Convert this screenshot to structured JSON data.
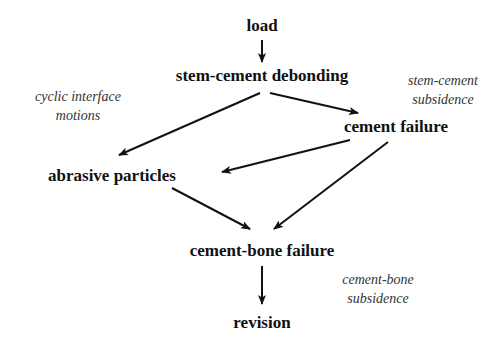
{
  "diagram": {
    "nodes": [
      {
        "id": "load",
        "label": "load"
      },
      {
        "id": "debond",
        "label": "stem-cement debonding"
      },
      {
        "id": "cement_failure",
        "label": "cement failure"
      },
      {
        "id": "abrasive",
        "label": "abrasive particles"
      },
      {
        "id": "cb_failure",
        "label": "cement-bone failure"
      },
      {
        "id": "revision",
        "label": "revision"
      }
    ],
    "annotations": [
      {
        "id": "cyclic",
        "lines": [
          "cyclic interface",
          "motions"
        ]
      },
      {
        "id": "sc_subsidence",
        "lines": [
          "stem-cement",
          "subsidence"
        ]
      },
      {
        "id": "cb_subsidence",
        "lines": [
          "cement-bone",
          "subsidence"
        ]
      }
    ],
    "edges": [
      {
        "from": "load",
        "to": "debond"
      },
      {
        "from": "debond",
        "to": "abrasive"
      },
      {
        "from": "debond",
        "to": "cement_failure"
      },
      {
        "from": "cement_failure",
        "to": "abrasive"
      },
      {
        "from": "cement_failure",
        "to": "cb_failure"
      },
      {
        "from": "abrasive",
        "to": "cb_failure"
      },
      {
        "from": "cb_failure",
        "to": "revision"
      }
    ]
  }
}
